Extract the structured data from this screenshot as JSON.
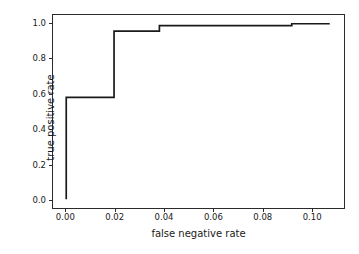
{
  "chart_data": {
    "type": "line",
    "title": "",
    "xlabel": "false negative rate",
    "ylabel": "true positive rate",
    "xlim": [
      -0.0054,
      0.1133
    ],
    "ylim": [
      -0.05,
      1.05
    ],
    "grid": false,
    "legend": null,
    "line_color": "#1a1a1a",
    "line_width": 1.6,
    "drawstyle": "steps-post",
    "xticks": [
      0.0,
      0.02,
      0.04,
      0.06,
      0.08,
      0.1
    ],
    "xticklabels": [
      "0.00",
      "0.02",
      "0.04",
      "0.06",
      "0.08",
      "0.10"
    ],
    "yticks": [
      0.0,
      0.2,
      0.4,
      0.6,
      0.8,
      1.0
    ],
    "yticklabels": [
      "0.0",
      "0.2",
      "0.4",
      "0.6",
      "0.8",
      "1.0"
    ],
    "series": [
      {
        "name": "ROC curve",
        "x": [
          0.0,
          0.0,
          0.0195,
          0.0195,
          0.038,
          0.038,
          0.092,
          0.092,
          0.1075
        ],
        "y": [
          0.0,
          0.58,
          0.58,
          0.958,
          0.958,
          0.99,
          0.99,
          1.0,
          1.0
        ]
      }
    ]
  }
}
